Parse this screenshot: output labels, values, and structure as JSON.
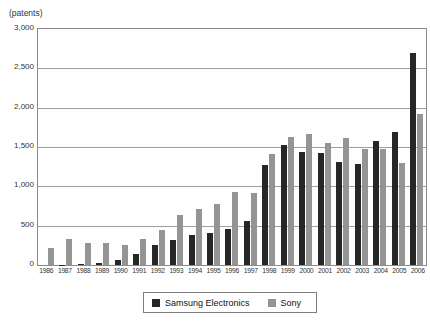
{
  "chart": {
    "unit_label": "(patents)"
  },
  "chart_data": {
    "type": "bar",
    "title": "",
    "unit_label": "(patents)",
    "xlabel": "",
    "ylabel": "patents",
    "categories": [
      "1986",
      "1987",
      "1988",
      "1989",
      "1990",
      "1991",
      "1992",
      "1993",
      "1994",
      "1995",
      "1996",
      "1997",
      "1998",
      "1999",
      "2000",
      "2001",
      "2002",
      "2003",
      "2004",
      "2005",
      "2006"
    ],
    "series": [
      {
        "name": "Samsung Electronics",
        "color": "#262626",
        "values": [
          0,
          5,
          15,
          25,
          60,
          140,
          250,
          320,
          380,
          410,
          455,
          560,
          1270,
          1530,
          1435,
          1420,
          1305,
          1290,
          1575,
          1690,
          2690
        ]
      },
      {
        "name": "Sony",
        "color": "#949494",
        "values": [
          210,
          325,
          280,
          285,
          250,
          330,
          440,
          630,
          710,
          770,
          930,
          920,
          1415,
          1630,
          1670,
          1550,
          1615,
          1470,
          1470,
          1300,
          1925
        ]
      }
    ],
    "ylim": [
      0,
      3000
    ],
    "ytick_interval": 500,
    "ytick_labels": [
      "0",
      "500",
      "1,000",
      "1,500",
      "2,000",
      "2,500",
      "3,000"
    ],
    "grid": true,
    "legend_position": "bottom"
  }
}
